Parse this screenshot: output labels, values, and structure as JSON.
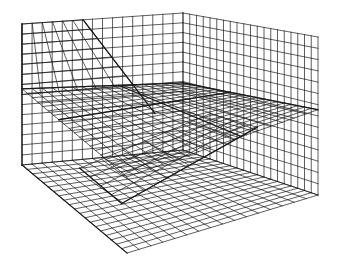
{
  "figure": {
    "stroke_color": "#1a1a1a",
    "background": "#ffffff",
    "stroke_width": 0.7,
    "heavy_stroke_width": 1.3
  },
  "geometry": {
    "floor": {
      "front": [
        127,
        253
      ],
      "left": [
        22,
        165
      ],
      "back": [
        183,
        150
      ],
      "right": [
        318,
        195
      ]
    },
    "top": {
      "front": [
        127,
        112
      ],
      "left": [
        22,
        24
      ],
      "back": [
        183,
        13
      ],
      "right": [
        318,
        37
      ]
    },
    "grid_divisions": {
      "left_wall_u": 16,
      "right_wall_u": 20,
      "height_v": 14
    },
    "mid_plane_level": 0.46,
    "partition_fraction": 0.5
  }
}
